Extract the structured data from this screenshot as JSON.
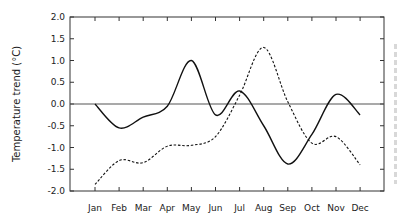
{
  "chart_data": {
    "type": "line",
    "title": "",
    "xlabel": "",
    "ylabel": "Temperature trend (°C)",
    "categories": [
      "Jan",
      "Feb",
      "Mar",
      "Apr",
      "May",
      "Jun",
      "Jul",
      "Aug",
      "Sep",
      "Oct",
      "Nov",
      "Dec"
    ],
    "ylim": [
      -2.0,
      2.0
    ],
    "yticks": [
      "2.0",
      "1.5",
      "1.0",
      "0.5",
      "0.0",
      "-0.5",
      "-1.0",
      "-1.5",
      "-2.0"
    ],
    "ytick_values": [
      2.0,
      1.5,
      1.0,
      0.5,
      0.0,
      -0.5,
      -1.0,
      -1.5,
      -2.0
    ],
    "grid": false,
    "zero_line": true,
    "legend": null,
    "series": [
      {
        "name": "solid",
        "style": "solid",
        "color": "#111111",
        "values": [
          0.0,
          -0.55,
          -0.3,
          -0.05,
          1.0,
          -0.25,
          0.3,
          -0.5,
          -1.38,
          -0.7,
          0.22,
          -0.25
        ]
      },
      {
        "name": "dashed",
        "style": "dashed",
        "color": "#111111",
        "values": [
          -1.85,
          -1.3,
          -1.35,
          -0.97,
          -0.95,
          -0.75,
          0.2,
          1.3,
          0.05,
          -0.9,
          -0.75,
          -1.4
        ]
      }
    ]
  },
  "layout": {
    "plot_left": 70,
    "plot_right": 384,
    "plot_top": 17,
    "plot_bottom": 191,
    "first_x": 95,
    "x_step": 24.1
  },
  "colors": {
    "axis": "#333333",
    "zero_line": "#555555",
    "line": "#111111"
  }
}
